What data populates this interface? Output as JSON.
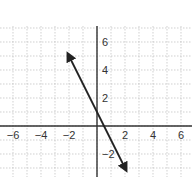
{
  "chart_data": {
    "type": "line",
    "title": "",
    "xlabel": "",
    "ylabel": "",
    "xlim": [
      -7,
      7
    ],
    "ylim": [
      -4,
      7
    ],
    "grid": true,
    "x_ticks": [
      -6,
      -4,
      -2,
      2,
      4,
      6
    ],
    "y_ticks": [
      6,
      4,
      2,
      -2
    ],
    "x_tick_labels": [
      "−6",
      "−4",
      "−2",
      "2",
      "4",
      "6"
    ],
    "y_tick_labels": [
      "6",
      "4",
      "2",
      "−2"
    ],
    "series": [
      {
        "name": "y = -2x + 1",
        "x": [
          -2,
          2
        ],
        "y": [
          5,
          -3
        ],
        "arrows": "both",
        "color": "#222222"
      }
    ]
  },
  "colors": {
    "axis": "#333333",
    "grid": "#bbbbbb",
    "line": "#222222"
  }
}
